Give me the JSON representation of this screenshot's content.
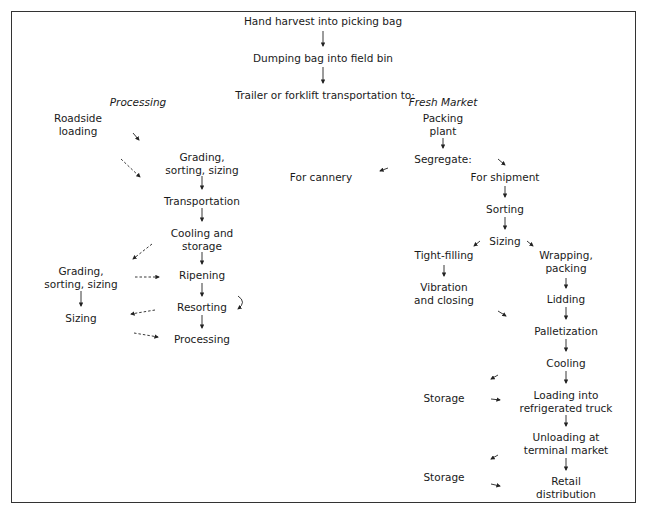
{
  "top": [
    {
      "id": "harvest",
      "label": "Hand harvest into picking bag"
    },
    {
      "id": "dump",
      "label": "Dumping bag into field bin"
    },
    {
      "id": "trailer",
      "label": "Trailer or forklift transportation to:"
    }
  ],
  "processing": {
    "heading": "Processing",
    "roadside": "Roadside\nloading",
    "grading1": "Grading,\nsorting, sizing",
    "transport": "Transportation",
    "cooling": "Cooling and\nstorage",
    "ripening": "Ripening",
    "resorting": "Resorting",
    "processing": "Processing",
    "grading2": "Grading,\nsorting, sizing",
    "sizing": "Sizing"
  },
  "fresh": {
    "heading": "Fresh Market",
    "packing": "Packing\nplant",
    "segregate": "Segregate:",
    "cannery": "For cannery",
    "shipment": "For shipment",
    "sorting": "Sorting",
    "sizing": "Sizing",
    "tight": "Tight-filling",
    "vibration": "Vibration\nand closing",
    "wrapping": "Wrapping,\npacking",
    "lidding": "Lidding",
    "pallet": "Palletization",
    "cooling": "Cooling",
    "storage1": "Storage",
    "loading": "Loading into\nrefrigerated truck",
    "unloading": "Unloading at\nterminal market",
    "storage2": "Storage",
    "retail": "Retail\ndistribution"
  },
  "colors": {
    "line": "#222222",
    "border": "#333333"
  }
}
